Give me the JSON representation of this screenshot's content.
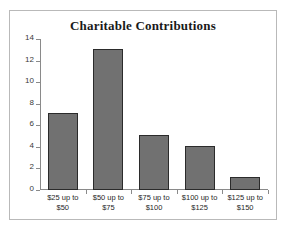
{
  "chart_data": {
    "type": "bar",
    "title": "Charitable Contributions",
    "xlabel": "",
    "ylabel": "",
    "categories": [
      "$25 up to $50",
      "$50 up to $75",
      "$75 up to $100",
      "$100 up to $125",
      "$125 up to $150"
    ],
    "values": [
      7.1,
      13.1,
      5.1,
      4.1,
      1.2
    ],
    "ylim": [
      0,
      14
    ],
    "yticks": [
      0,
      2,
      4,
      6,
      8,
      10,
      12,
      14
    ],
    "ytick_labels": [
      "0",
      "2",
      "4",
      "6",
      "8",
      "10",
      "12",
      "14"
    ],
    "grid": false,
    "legend": null,
    "series": [
      {
        "name": "Frequency",
        "values": [
          7.1,
          13.1,
          5.1,
          4.1,
          1.2
        ]
      }
    ],
    "colors": {
      "bar_fill": "#717171",
      "bar_border": "#2b2b2b",
      "axis": "#8a8a8a",
      "frame": "#b9b9b9",
      "background": "#ffffff",
      "title_text": "#1a1a1a",
      "tick_text": "#3a3a3a"
    }
  }
}
